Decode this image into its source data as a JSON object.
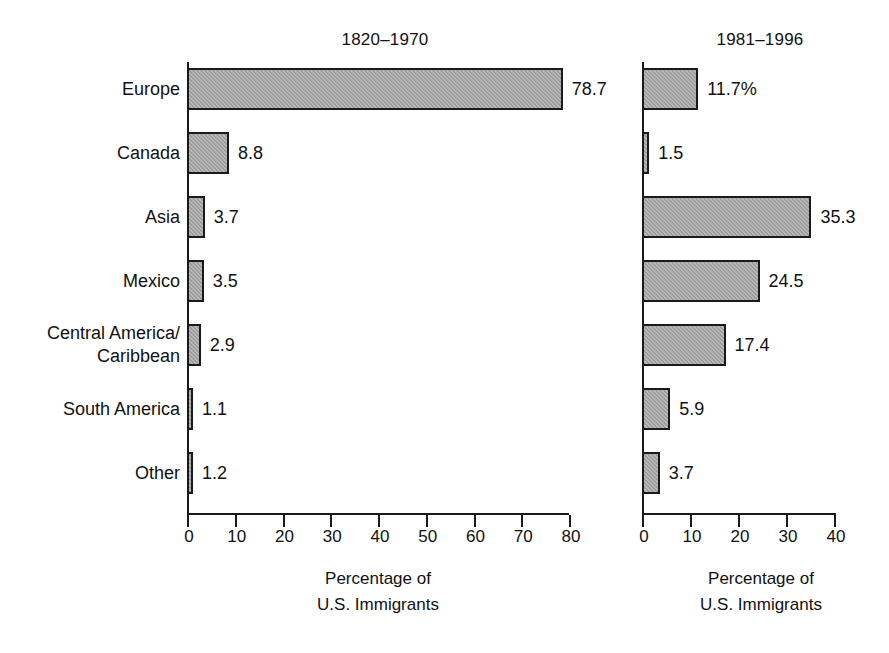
{
  "chart_data": [
    {
      "type": "bar",
      "orientation": "horizontal",
      "title": "1820–1970",
      "xlabel": "Percentage of\nU.S. Immigrants",
      "ylabel": "",
      "categories": [
        "Europe",
        "Canada",
        "Asia",
        "Mexico",
        "Central America/\nCaribbean",
        "South America",
        "Other"
      ],
      "values": [
        78.7,
        8.8,
        3.7,
        3.5,
        2.9,
        1.1,
        1.2
      ],
      "value_labels": [
        "78.7",
        "8.8",
        "3.7",
        "3.5",
        "2.9",
        "1.1",
        "1.2"
      ],
      "xlim": [
        0,
        80
      ],
      "xticks": [
        0,
        10,
        20,
        30,
        40,
        50,
        60,
        70,
        80
      ],
      "xticklabels": [
        "0",
        "10",
        "20",
        "30",
        "40",
        "50",
        "60",
        "70",
        "80"
      ],
      "grid": false,
      "legend": "none",
      "bar_fill": "#9b9b9b",
      "bar_edge": "#1a1a1a"
    },
    {
      "type": "bar",
      "orientation": "horizontal",
      "title": "1981–1996",
      "xlabel": "Percentage of\nU.S. Immigrants",
      "ylabel": "",
      "categories": [
        "Europe",
        "Canada",
        "Asia",
        "Mexico",
        "Central America/\nCaribbean",
        "South America",
        "Other"
      ],
      "values": [
        11.7,
        1.5,
        35.3,
        24.5,
        17.4,
        5.9,
        3.7
      ],
      "value_labels": [
        "11.7%",
        "1.5",
        "35.3",
        "24.5",
        "17.4",
        "5.9",
        "3.7"
      ],
      "xlim": [
        0,
        40
      ],
      "xticks": [
        0,
        10,
        20,
        30,
        40
      ],
      "xticklabels": [
        "0",
        "10",
        "20",
        "30",
        "40"
      ],
      "grid": false,
      "legend": "none",
      "bar_fill": "#9b9b9b",
      "bar_edge": "#1a1a1a"
    }
  ],
  "panels": {
    "left": {
      "title": "1820–1970",
      "caption": "Percentage of\nU.S. Immigrants",
      "tick_labels": [
        "0",
        "10",
        "20",
        "30",
        "40",
        "50",
        "60",
        "70",
        "80"
      ],
      "bar_labels": [
        "78.7",
        "8.8",
        "3.7",
        "3.5",
        "2.9",
        "1.1",
        "1.2"
      ]
    },
    "right": {
      "title": "1981–1996",
      "caption": "Percentage of\nU.S. Immigrants",
      "tick_labels": [
        "0",
        "10",
        "20",
        "30",
        "40"
      ],
      "bar_labels": [
        "11.7%",
        "1.5",
        "35.3",
        "24.5",
        "17.4",
        "5.9",
        "3.7"
      ]
    }
  },
  "categories": [
    "Europe",
    "Canada",
    "Asia",
    "Mexico",
    "Central America/\nCaribbean",
    "South America",
    "Other"
  ]
}
